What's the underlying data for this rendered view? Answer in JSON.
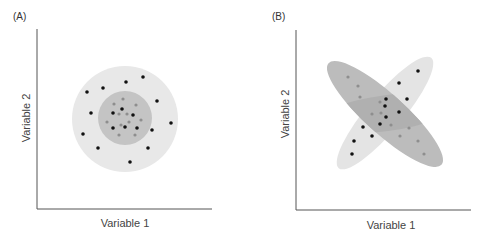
{
  "panels": [
    {
      "id": "A",
      "label": "(A)",
      "xlabel": "Variable 1",
      "ylabel": "Variable 2"
    },
    {
      "id": "B",
      "label": "(B)",
      "xlabel": "Variable 1",
      "ylabel": "Variable 2"
    }
  ],
  "colors": {
    "outer_region": "#e8e8e8",
    "inner_region": "#c4c4c4",
    "ellipse_light": "#e4e4e4",
    "ellipse_dark": "#bcbcbc",
    "overlap": "#b0b0b0",
    "point_black": "#111111",
    "point_gray": "#8e8e8e",
    "axis": "#555555"
  },
  "chart_data": [
    {
      "type": "scatter",
      "title": "(A)",
      "xlabel": "Variable 1",
      "ylabel": "Variable 2",
      "grid": false,
      "regions": [
        {
          "shape": "circle",
          "name": "outer",
          "cx": 125,
          "cy": 119,
          "r": 53,
          "fill": "#e8e8e8"
        },
        {
          "shape": "circle",
          "name": "inner",
          "cx": 125,
          "cy": 118,
          "r": 27,
          "fill": "#c4c4c4"
        }
      ],
      "series": [
        {
          "name": "black",
          "points": [
            [
              87,
              92
            ],
            [
              103,
              88
            ],
            [
              126,
              82
            ],
            [
              143,
              77
            ],
            [
              157,
              101
            ],
            [
              91,
              113
            ],
            [
              171,
              123
            ],
            [
              83,
              134
            ],
            [
              152,
              130
            ],
            [
              98,
              148
            ],
            [
              148,
              148
            ],
            [
              130,
              162
            ],
            [
              122,
              109
            ],
            [
              113,
              113
            ],
            [
              133,
              115
            ],
            [
              113,
              128
            ],
            [
              125,
              127
            ],
            [
              137,
              128
            ]
          ]
        },
        {
          "name": "gray",
          "points": [
            [
              123,
              99
            ],
            [
              114,
              104
            ],
            [
              136,
              105
            ],
            [
              119,
              114
            ],
            [
              127,
              114
            ],
            [
              107,
              122
            ],
            [
              141,
              120
            ],
            [
              121,
              125
            ],
            [
              129,
              122
            ],
            [
              119,
              135
            ],
            [
              135,
              135
            ]
          ]
        }
      ]
    },
    {
      "type": "scatter",
      "title": "(B)",
      "xlabel": "Variable 1",
      "ylabel": "Variable 2",
      "grid": false,
      "regions": [
        {
          "shape": "ellipse",
          "name": "light",
          "cx": 385,
          "cy": 113,
          "rx": 72,
          "ry": 18,
          "rotate": -50,
          "fill": "#e4e4e4"
        },
        {
          "shape": "ellipse",
          "name": "dark",
          "cx": 385,
          "cy": 114,
          "rx": 76,
          "ry": 20,
          "rotate": 42,
          "fill": "#bcbcbc"
        }
      ],
      "series": [
        {
          "name": "black",
          "points": [
            [
              418,
              71
            ],
            [
              399,
              83
            ],
            [
              407,
              99
            ],
            [
              386,
              99
            ],
            [
              385,
              106
            ],
            [
              399,
              112
            ],
            [
              386,
              117
            ],
            [
              380,
              124
            ],
            [
              363,
              127
            ],
            [
              372,
              136
            ],
            [
              354,
              141
            ],
            [
              352,
              154
            ]
          ]
        },
        {
          "name": "gray",
          "points": [
            [
              348,
              77
            ],
            [
              358,
              86
            ],
            [
              360,
              97
            ],
            [
              380,
              102
            ],
            [
              372,
              114
            ],
            [
              381,
              113
            ],
            [
              391,
              125
            ],
            [
              409,
              128
            ],
            [
              400,
              136
            ],
            [
              418,
              141
            ],
            [
              424,
              154
            ]
          ]
        }
      ]
    }
  ]
}
